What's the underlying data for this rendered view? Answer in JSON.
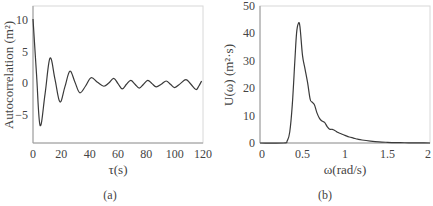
{
  "chart_data": [
    {
      "type": "line",
      "panel": "(a)",
      "title": "",
      "xlabel": "τ(s)",
      "ylabel": "Autocorrelation (m²)",
      "xlim": [
        0,
        120
      ],
      "ylim": [
        -9,
        12
      ],
      "xticks": [
        0,
        20,
        40,
        60,
        80,
        100,
        120
      ],
      "yticks": [
        -5,
        0,
        5,
        10
      ],
      "grid": false,
      "legend": null,
      "series": [
        {
          "name": "Autocorrelation",
          "x": [
            0,
            2.5,
            5,
            8.5,
            12,
            15.5,
            19,
            22.5,
            26,
            29.5,
            33,
            37,
            41,
            45.5,
            50,
            53.5,
            57,
            60,
            63,
            66,
            69,
            72,
            75,
            78,
            81,
            84,
            87,
            90.5,
            94,
            97,
            100,
            104,
            108,
            111.5,
            115,
            117,
            119
          ],
          "values": [
            10,
            1.5,
            -6.3,
            -1.5,
            4,
            0.8,
            -2.7,
            -0.4,
            2,
            0.4,
            -1.3,
            -0.3,
            1,
            0.3,
            -0.3,
            0.2,
            0.9,
            0.1,
            -0.7,
            0,
            0.6,
            0,
            -0.6,
            0,
            0.6,
            0.1,
            -0.4,
            0,
            0.5,
            0,
            -0.5,
            0.1,
            0.7,
            0,
            -0.8,
            -0.3,
            0.5
          ]
        }
      ]
    },
    {
      "type": "line",
      "panel": "(b)",
      "title": "",
      "xlabel": "ω(rad/s)",
      "ylabel": "U(ω)  (m²·s)",
      "xlim": [
        0,
        2
      ],
      "ylim": [
        0,
        50
      ],
      "xticks": [
        0,
        0.5,
        1,
        1.5,
        2
      ],
      "yticks": [
        0,
        10,
        20,
        30,
        40,
        50
      ],
      "grid": false,
      "legend": null,
      "series": [
        {
          "name": "Spectrum",
          "x": [
            0,
            0.28,
            0.32,
            0.35,
            0.38,
            0.41,
            0.43,
            0.45,
            0.47,
            0.5,
            0.53,
            0.56,
            0.59,
            0.61,
            0.64,
            0.67,
            0.7,
            0.73,
            0.76,
            0.79,
            0.82,
            0.85,
            0.88,
            0.92,
            0.96,
            1.0,
            1.05,
            1.1,
            1.15,
            1.2,
            1.3,
            1.4,
            1.5,
            1.6,
            1.7,
            1.8,
            1.9,
            2.0
          ],
          "values": [
            0,
            0,
            0.8,
            4,
            14,
            30,
            40,
            43.5,
            42.5,
            32,
            27,
            22,
            16,
            15,
            14,
            11,
            9,
            8,
            7.5,
            6,
            5,
            5,
            4.6,
            3.8,
            3.3,
            2.8,
            2.2,
            1.8,
            1.4,
            1.1,
            0.7,
            0.4,
            0.25,
            0.15,
            0.1,
            0.05,
            0.02,
            0
          ]
        }
      ]
    }
  ],
  "panels": {
    "a": {
      "label": "(a)",
      "xlabel": "τ(s)",
      "ylabel": "Autocorrelation (m²)",
      "xtick_labels": [
        "0",
        "20",
        "40",
        "60",
        "80",
        "100",
        "120"
      ],
      "ytick_labels": [
        "10",
        "5",
        "0",
        "−5"
      ]
    },
    "b": {
      "label": "(b)",
      "xlabel": "ω(rad/s)",
      "ylabel": "U(ω)  (m²·s)",
      "xtick_labels": [
        "0",
        "0.5",
        "1",
        "1.5",
        "2"
      ],
      "ytick_labels": [
        "50",
        "40",
        "30",
        "20",
        "10",
        "0"
      ]
    }
  }
}
